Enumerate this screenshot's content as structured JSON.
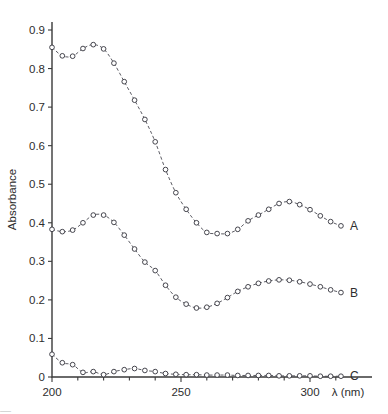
{
  "chart_data": {
    "type": "line",
    "title": "",
    "subtitle": "",
    "xlabel": "λ (nm)",
    "ylabel": "Absorbance",
    "xlim": [
      200,
      315
    ],
    "ylim": [
      0,
      0.93
    ],
    "grid": false,
    "legend_position": "right-of-curve-ends",
    "x_ticks_major": [
      200,
      250,
      300
    ],
    "x_tick_labels": [
      "200",
      "250",
      "300"
    ],
    "x_ticks_minor": [
      210,
      220,
      230,
      240,
      260,
      270,
      280,
      290,
      310
    ],
    "y_ticks": [
      0,
      0.1,
      0.2,
      0.3,
      0.4,
      0.5,
      0.6,
      0.7,
      0.8,
      0.9
    ],
    "y_tick_labels": [
      "0",
      "0.1",
      "0.2",
      "0.3",
      "0.4",
      "0.5",
      "0.6",
      "0.7",
      "0.8",
      "0.9"
    ],
    "marker": "open-circle",
    "linestyle": "dashed",
    "series": [
      {
        "name": "A",
        "label": "A",
        "x": [
          200,
          204,
          208,
          212,
          216,
          220,
          224,
          228,
          232,
          236,
          240,
          244,
          248,
          252,
          256,
          260,
          264,
          268,
          272,
          276,
          280,
          284,
          288,
          292,
          296,
          300,
          304,
          308,
          312
        ],
        "values": [
          0.855,
          0.833,
          0.832,
          0.852,
          0.862,
          0.851,
          0.814,
          0.766,
          0.718,
          0.668,
          0.61,
          0.538,
          0.478,
          0.435,
          0.4,
          0.375,
          0.372,
          0.372,
          0.383,
          0.405,
          0.42,
          0.435,
          0.45,
          0.455,
          0.447,
          0.434,
          0.418,
          0.403,
          0.392
        ]
      },
      {
        "name": "B",
        "label": "B",
        "x": [
          200,
          204,
          208,
          212,
          216,
          220,
          224,
          228,
          232,
          236,
          240,
          244,
          248,
          252,
          256,
          260,
          264,
          268,
          272,
          276,
          280,
          284,
          288,
          292,
          296,
          300,
          304,
          308,
          312
        ],
        "values": [
          0.383,
          0.377,
          0.381,
          0.4,
          0.42,
          0.42,
          0.401,
          0.368,
          0.332,
          0.298,
          0.276,
          0.238,
          0.207,
          0.189,
          0.179,
          0.181,
          0.191,
          0.206,
          0.222,
          0.234,
          0.243,
          0.249,
          0.252,
          0.251,
          0.247,
          0.241,
          0.234,
          0.226,
          0.219
        ]
      },
      {
        "name": "C",
        "label": "C",
        "x": [
          200,
          204,
          208,
          212,
          216,
          220,
          224,
          228,
          232,
          236,
          240,
          244,
          248,
          252,
          256,
          260,
          264,
          268,
          272,
          276,
          280,
          284,
          288,
          292,
          296,
          300,
          304,
          308,
          312
        ],
        "values": [
          0.059,
          0.037,
          0.032,
          0.012,
          0.014,
          0.006,
          0.014,
          0.019,
          0.022,
          0.017,
          0.014,
          0.009,
          0.007,
          0.006,
          0.006,
          0.005,
          0.005,
          0.005,
          0.004,
          0.004,
          0.004,
          0.004,
          0.003,
          0.003,
          0.003,
          0.003,
          0.002,
          0.002,
          0.002
        ]
      }
    ]
  },
  "axes": {
    "y_axis_title": "Absorbance",
    "x_axis_title": "λ (nm)"
  },
  "caption_strip": {
    "text": "—"
  }
}
